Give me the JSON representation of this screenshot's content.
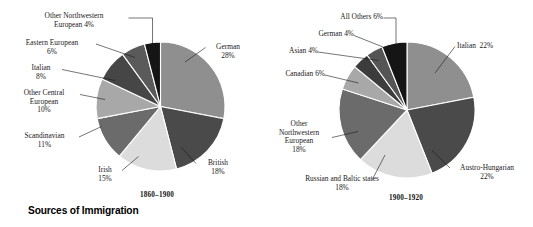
{
  "figure": {
    "title": "Sources of Immigration",
    "background": "#ffffff",
    "text_color": "#1a1a1a"
  },
  "chart_data": [
    {
      "type": "pie",
      "title": "1860–1900",
      "xlabel": "",
      "ylabel": "",
      "legend": "none",
      "grid": false,
      "categories": [
        "German",
        "British",
        "Irish",
        "Scandinavian",
        "Other Central European",
        "Italian",
        "Eastern European",
        "Other Northwestern European"
      ],
      "values": [
        28,
        18,
        15,
        11,
        10,
        8,
        6,
        4
      ],
      "units": "percent",
      "labels": [
        "German 28%",
        "British 18%",
        "Irish 15%",
        "Scandinavian 11%",
        "Other Central European 10%",
        "Italian 8%",
        "Eastern European 6%",
        "Other Northwestern European 4%"
      ],
      "colors": [
        "#8f8f8f",
        "#4a4a4a",
        "#dcdcdc",
        "#6b6b6b",
        "#a8a8a8",
        "#464646",
        "#5a5a5a",
        "#151515"
      ]
    },
    {
      "type": "pie",
      "title": "1900–1920",
      "xlabel": "",
      "ylabel": "",
      "legend": "none",
      "grid": false,
      "categories": [
        "Italian",
        "Austro-Hungarian",
        "Russian and Baltic states",
        "Other Northwestern European",
        "Canadian",
        "Asian",
        "German",
        "All Others"
      ],
      "values": [
        22,
        22,
        18,
        18,
        6,
        4,
        4,
        6
      ],
      "units": "percent",
      "labels": [
        "Italian 22%",
        "Austro-Hungarian 22%",
        "Russian and Baltic states 18%",
        "Other Northwestern European 18%",
        "Canadian 6%",
        "Asian 4%",
        "German 4%",
        "All Others 6%"
      ],
      "colors": [
        "#8f8f8f",
        "#4a4a4a",
        "#dcdcdc",
        "#6b6b6b",
        "#a8a8a8",
        "#3c3c3c",
        "#555555",
        "#151515"
      ]
    }
  ],
  "left_chart": {
    "period": "1860–1900",
    "labels": {
      "german": "German\n28%",
      "british": "British\n18%",
      "irish": "Irish\n15%",
      "scandinavian": "Scandinavian\n11%",
      "other_central_european": "Other Central\nEuropean\n10%",
      "italian": "Italian\n8%",
      "eastern_european": "Eastern European\n6%",
      "other_northwestern_european": "Other Northwestern\nEuropean 4%"
    }
  },
  "right_chart": {
    "period": "1900–1920",
    "labels": {
      "italian": "Italian  22%",
      "austro_hungarian": "Austro-Hungarian\n22%",
      "russian_baltic": "Russian and Baltic states\n18%",
      "other_northwestern_european": "Other\nNorthwestern\nEuropean\n18%",
      "canadian": "Canadian 6%",
      "asian": "Asian 4%",
      "german": "German 4%",
      "all_others": "All Others 6%"
    }
  }
}
